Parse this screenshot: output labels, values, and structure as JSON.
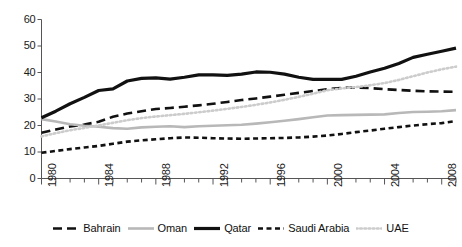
{
  "chart_data": {
    "type": "line",
    "title": "",
    "subtitle": "",
    "xlabel": "",
    "ylabel": "",
    "xlim": [
      1980,
      2009
    ],
    "ylim": [
      0,
      60
    ],
    "yticks": [
      0,
      10,
      20,
      30,
      40,
      50,
      60
    ],
    "ytick_labels": [
      "0",
      "10",
      "20",
      "30",
      "40",
      "50",
      "60"
    ],
    "x": [
      1980,
      1981,
      1982,
      1983,
      1984,
      1985,
      1986,
      1987,
      1988,
      1989,
      1990,
      1991,
      1992,
      1993,
      1994,
      1995,
      1996,
      1997,
      1998,
      1999,
      2000,
      2001,
      2002,
      2003,
      2004,
      2005,
      2006,
      2007,
      2008,
      2009
    ],
    "xtick_values": [
      1980,
      1981,
      1982,
      1983,
      1984,
      1985,
      1986,
      1987,
      1988,
      1989,
      1990,
      1991,
      1992,
      1993,
      1994,
      1995,
      1996,
      1997,
      1998,
      1999,
      2000,
      2001,
      2002,
      2003,
      2004,
      2005,
      2006,
      2007,
      2008,
      2009
    ],
    "xtick_labels": [
      "1980",
      "1984",
      "1988",
      "1992",
      "1996",
      "2000",
      "2004",
      "2008"
    ],
    "xtick_labeled_values": [
      1980,
      1984,
      1988,
      1992,
      1996,
      2000,
      2004,
      2008
    ],
    "xtick_label_rotation": -90,
    "grid": false,
    "legend_position": "bottom",
    "series": [
      {
        "name": "Bahrain",
        "color": "#111111",
        "style": "dashed",
        "width": 2.6,
        "dasharray": "9,5",
        "values": [
          17.3,
          18.5,
          19.6,
          20.4,
          21.4,
          23.3,
          24.5,
          25.4,
          26.2,
          26.6,
          27.1,
          27.6,
          28.2,
          28.9,
          29.6,
          30.2,
          30.9,
          31.6,
          32.3,
          33.0,
          33.7,
          34.2,
          34.3,
          34.1,
          33.7,
          33.4,
          33.1,
          32.9,
          32.8,
          32.7
        ]
      },
      {
        "name": "Oman",
        "color": "#b8b8b8",
        "style": "solid",
        "width": 2.6,
        "dasharray": "",
        "values": [
          22.4,
          21.5,
          20.5,
          19.9,
          19.5,
          19.0,
          18.8,
          19.3,
          19.5,
          19.7,
          19.4,
          19.7,
          19.9,
          20.1,
          20.3,
          20.7,
          21.2,
          21.8,
          22.4,
          23.1,
          23.8,
          23.9,
          24.0,
          24.1,
          24.2,
          24.7,
          25.1,
          25.2,
          25.4,
          25.8
        ]
      },
      {
        "name": "Qatar",
        "color": "#111111",
        "style": "solid",
        "width": 3.2,
        "dasharray": "",
        "values": [
          22.9,
          25.4,
          28.2,
          30.6,
          33.2,
          33.8,
          36.8,
          37.8,
          38.0,
          37.5,
          38.2,
          39.1,
          39.1,
          38.9,
          39.4,
          40.2,
          40.1,
          39.4,
          38.2,
          37.4,
          37.4,
          37.4,
          38.6,
          40.2,
          41.6,
          43.4,
          45.7,
          46.9,
          48.0,
          49.2
        ]
      },
      {
        "name": "Saudi Arabia",
        "color": "#111111",
        "style": "dotted-dash",
        "width": 2.6,
        "dasharray": "5,3.5",
        "values": [
          9.7,
          10.4,
          11.1,
          11.7,
          12.3,
          13.1,
          13.9,
          14.4,
          14.8,
          15.2,
          15.5,
          15.4,
          15.2,
          15.1,
          15.0,
          15.1,
          15.2,
          15.3,
          15.5,
          15.8,
          16.2,
          16.8,
          17.5,
          18.1,
          18.8,
          19.4,
          20.0,
          20.5,
          20.9,
          21.7
        ]
      },
      {
        "name": "UAE",
        "color": "#cccccc",
        "style": "dotted",
        "width": 2.6,
        "dasharray": "1.6,2.6",
        "values": [
          15.9,
          17.1,
          18.2,
          19.1,
          20.0,
          21.0,
          22.0,
          22.8,
          23.4,
          23.9,
          24.4,
          25.0,
          25.6,
          26.3,
          27.0,
          27.8,
          28.7,
          29.7,
          30.8,
          32.0,
          33.3,
          34.0,
          34.5,
          35.2,
          36.0,
          37.2,
          38.6,
          40.0,
          41.2,
          42.2
        ]
      }
    ]
  },
  "axis": {
    "line_color": "#555555"
  },
  "legend": {
    "items": [
      {
        "label": "Bahrain",
        "swatch": "dashed-black-swatch"
      },
      {
        "label": "Oman",
        "swatch": "solid-gray-swatch"
      },
      {
        "label": "Qatar",
        "swatch": "solid-black-swatch"
      },
      {
        "label": "Saudi Arabia",
        "swatch": "dotted-dash-black-swatch"
      },
      {
        "label": "UAE",
        "swatch": "dotted-gray-swatch"
      }
    ]
  }
}
